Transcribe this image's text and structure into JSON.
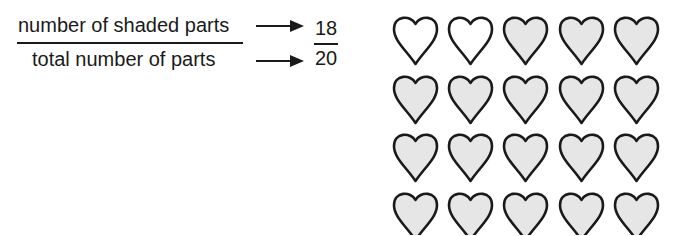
{
  "fraction_explanation": {
    "numerator_label": "number of shaded parts",
    "denominator_label": "total number of parts",
    "numerator_value": "18",
    "denominator_value": "20"
  },
  "heart_grid": {
    "rows": 4,
    "columns": 5,
    "shaded_count": 18,
    "total_count": 20,
    "shaded_color": "#e6e6e6",
    "unshaded_color": "#ffffff",
    "outline_color": "#1a1a1a",
    "cells": [
      [
        false,
        false,
        true,
        true,
        true
      ],
      [
        true,
        true,
        true,
        true,
        true
      ],
      [
        true,
        true,
        true,
        true,
        true
      ],
      [
        true,
        true,
        true,
        true,
        true
      ]
    ]
  }
}
